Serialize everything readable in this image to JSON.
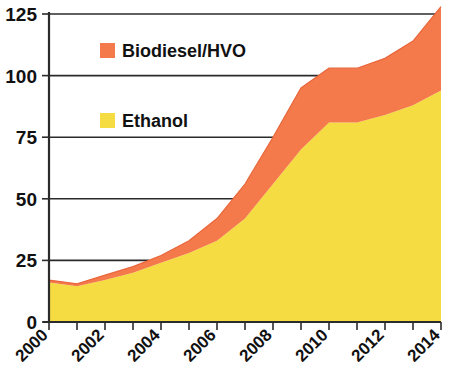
{
  "chart_data": {
    "type": "area",
    "title": "",
    "subtitle": "",
    "xlabel": "",
    "ylabel": "",
    "stacked": true,
    "grid": true,
    "legend_position": "inside-upper-left",
    "xlim": [
      2000,
      2014
    ],
    "ylim": [
      0,
      125
    ],
    "yticks": [
      0,
      25,
      50,
      75,
      100,
      125
    ],
    "ytick_labels": [
      "0",
      "25",
      "50",
      "75",
      "100",
      "125"
    ],
    "x": [
      2000,
      2001,
      2002,
      2003,
      2004,
      2005,
      2006,
      2007,
      2008,
      2009,
      2010,
      2011,
      2012,
      2013,
      2014
    ],
    "xtick_labels": [
      "2000",
      "",
      "2002",
      "",
      "2004",
      "",
      "2006",
      "",
      "2008",
      "",
      "2010",
      "",
      "2012",
      "",
      "2014"
    ],
    "xtick_labels_shown": [
      "2000",
      "2002",
      "2004",
      "2006",
      "2008",
      "2010",
      "2012",
      "2014"
    ],
    "series": [
      {
        "name": "Ethanol",
        "color": "#F5DC42",
        "values": [
          16,
          14.5,
          17,
          20,
          24,
          28,
          33,
          42,
          56,
          70,
          81,
          81,
          84,
          88,
          94
        ]
      },
      {
        "name": "Biodiesel/HVO",
        "color": "#F47A4C",
        "values": [
          1,
          1,
          2,
          2.5,
          3,
          5,
          9,
          14,
          19,
          25,
          22,
          22,
          23,
          26,
          34
        ]
      }
    ],
    "totals": [
      17,
      15.5,
      19,
      22.5,
      27,
      33,
      42,
      56,
      75,
      95,
      103,
      103,
      107,
      114,
      128
    ]
  },
  "legend": {
    "items": [
      {
        "label": "Biodiesel/HVO",
        "color": "#F47A4C"
      },
      {
        "label": "Ethanol",
        "color": "#F5DC42"
      }
    ]
  },
  "colors": {
    "ethanol": "#F5DC42",
    "biodiesel": "#F47A4C",
    "axis": "#2b2b2b",
    "background": "#ffffff"
  }
}
